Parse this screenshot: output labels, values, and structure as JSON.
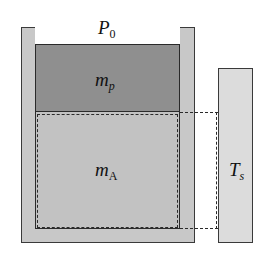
{
  "diagram": {
    "labels": {
      "ambient_pressure": {
        "main": "P",
        "sub": "0"
      },
      "piston_mass": {
        "main": "m",
        "sub": "p"
      },
      "gas_mass": {
        "main": "m",
        "sub": "A"
      },
      "reservoir_temperature": {
        "main": "T",
        "sub": "s"
      }
    },
    "colors": {
      "background": "#ffffff",
      "cylinder_wall": "#c8c8c8",
      "piston": "#8f8f8f",
      "gas": "#c2c2c2",
      "reservoir": "#dcdcdc",
      "outline": "#2a2a2a"
    }
  }
}
